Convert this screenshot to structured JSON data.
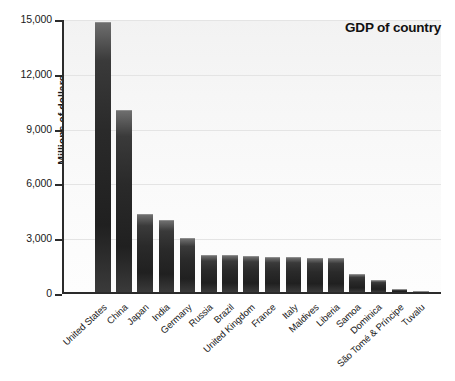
{
  "chart_data": {
    "type": "bar",
    "title": "GDP of country",
    "xlabel": "",
    "ylabel": "Millions of dollars",
    "ylim": [
      0,
      15000
    ],
    "yticks": [
      0,
      3000,
      6000,
      9000,
      12000,
      15000
    ],
    "ytick_labels": [
      "0",
      "3,000",
      "6,000",
      "9,000",
      "12,000",
      "15,000"
    ],
    "grid": true,
    "legend": null,
    "bar_color": "#2a2a2a",
    "categories": [
      "United States",
      "China",
      "Japan",
      "India",
      "Germany",
      "Russia",
      "Brazil",
      "United Kingdom",
      "France",
      "Italy",
      "Maldives",
      "Liberia",
      "Samoa",
      "Dominica",
      "São Tomé & Príncipe",
      "Tuvalu"
    ],
    "values": [
      14800,
      9950,
      4250,
      3950,
      2980,
      2050,
      2000,
      1960,
      1930,
      1900,
      1880,
      1860,
      1000,
      650,
      170,
      30
    ]
  },
  "plot": {
    "title_text": "GDP of country"
  }
}
